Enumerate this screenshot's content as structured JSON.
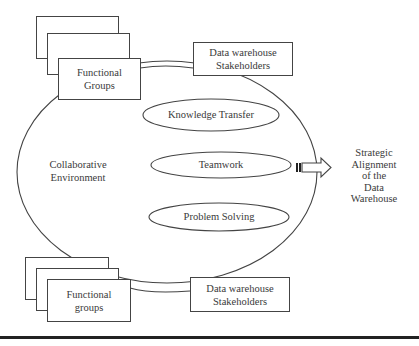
{
  "diagram": {
    "type": "concept-diagram",
    "top_left_group": {
      "label_line1": "Functional",
      "label_line2": "Groups",
      "stack_count": 3
    },
    "top_stakeholders": {
      "label_line1": "Data warehouse",
      "label_line2": "Stakeholders"
    },
    "bottom_left_group": {
      "label_line1": "Functional",
      "label_line2": "groups",
      "stack_count": 3
    },
    "bottom_stakeholders": {
      "label_line1": "Data warehouse",
      "label_line2": "Stakeholders"
    },
    "environment": {
      "label_line1": "Collaborative",
      "label_line2": "Environment"
    },
    "activities": [
      {
        "label": "Knowledge Transfer"
      },
      {
        "label": "Teamwork"
      },
      {
        "label": "Problem Solving"
      }
    ],
    "outcome": {
      "line1": "Strategic",
      "line2": "Alignment",
      "line3": "of the",
      "line4": "Data",
      "line5": "Warehouse"
    },
    "colors": {
      "stroke": "#444444",
      "text": "#3a3a3a",
      "background": "#ffffff",
      "rule": "#222222"
    }
  }
}
